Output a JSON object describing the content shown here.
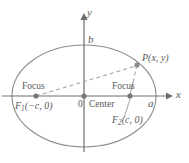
{
  "figure": {
    "type": "ellipse-geometry-diagram",
    "colors": {
      "background": "#ffffff",
      "curve": "#8c8c8c",
      "axis": "#6e6e6e",
      "dashed": "#9a9a9a",
      "point": "#777777",
      "text": "#595959"
    },
    "geometry": {
      "center": {
        "x": 84,
        "y": 96
      },
      "semi_major_px": 72,
      "semi_minor_px": 51,
      "focus_left": {
        "x": 36,
        "y": 96
      },
      "focus_right": {
        "x": 130,
        "y": 96
      },
      "point_p": {
        "x": 137,
        "y": 65
      },
      "x_axis": {
        "x1": 2,
        "x2": 170,
        "y": 96
      },
      "y_axis": {
        "x": 84,
        "y1": 14,
        "y2": 152
      }
    },
    "labels": {
      "y_axis": "y",
      "x_axis": "x",
      "semi_minor": "b",
      "semi_major": "a",
      "origin": "0",
      "center": "Center",
      "focus_left_word": "Focus",
      "focus_right_word": "Focus",
      "focus_left_coords_name": "F",
      "focus_left_coords_sub": "1",
      "focus_left_coords_rest": "(−c, 0)",
      "focus_right_coords_name": "F",
      "focus_right_coords_sub": "2",
      "focus_right_coords_rest": "(c, 0)",
      "point_name": "P",
      "point_coords": "(x, y)"
    }
  }
}
